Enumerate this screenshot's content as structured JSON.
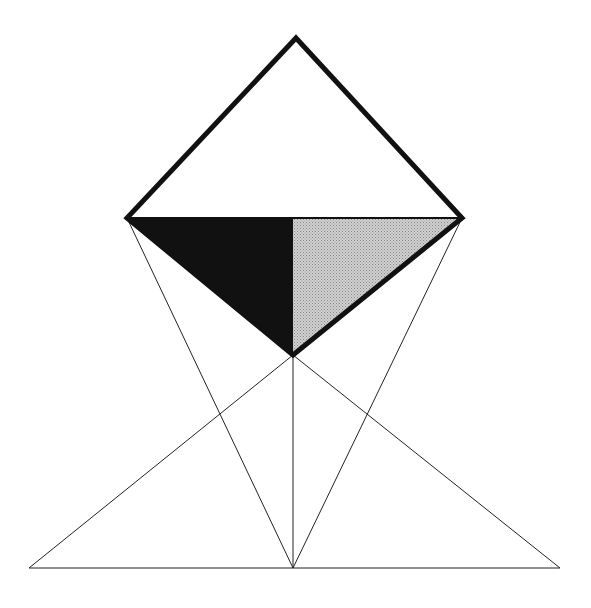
{
  "diagram": {
    "colors": {
      "background": "#ffffff",
      "stroke": "#111111",
      "dark_fill": "#111111",
      "light_fill": "#bdbdbd"
    },
    "points": {
      "top": [
        296,
        38
      ],
      "left": [
        127,
        218
      ],
      "right": [
        462,
        218
      ],
      "bottom": [
        293,
        355
      ],
      "base_left": [
        29,
        568
      ],
      "base_mid": [
        293,
        568
      ],
      "base_right": [
        560,
        568
      ]
    }
  }
}
